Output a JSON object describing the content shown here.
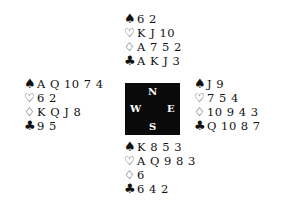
{
  "suits": {
    "spades": "♠",
    "hearts": "♡",
    "diamonds": "♢",
    "clubs": "♣"
  },
  "compass": {
    "north": "N",
    "south": "S",
    "west": "W",
    "east": "E"
  },
  "hands": {
    "north": {
      "spades": "6 2",
      "hearts": "K J 10",
      "diamonds": "A 7 5 2",
      "clubs": "A K J 3"
    },
    "west": {
      "spades": "A Q 10 7 4",
      "hearts": "6 2",
      "diamonds": "K Q J 8",
      "clubs": "9 5"
    },
    "east": {
      "spades": "J 9",
      "hearts": "7 5 4",
      "diamonds": "10 9 4 3",
      "clubs": "Q 10 8 7"
    },
    "south": {
      "spades": "K 8 5 3",
      "hearts": "A Q 9 8 3",
      "diamonds": "6",
      "clubs": "6 4 2"
    }
  }
}
